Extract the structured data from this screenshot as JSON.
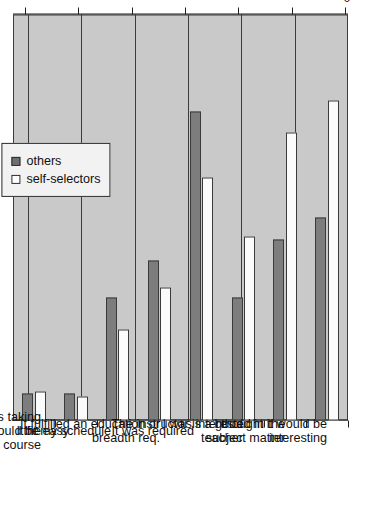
{
  "chart_data": {
    "type": "bar",
    "title": "",
    "subtitle": "",
    "orientation": "horizontal",
    "xlabel": "",
    "ylabel": "",
    "ylim": [
      0,
      60
    ],
    "grid": true,
    "legend_position": "top-left",
    "axis_ticks": [
      "0",
      "10",
      "20",
      "30",
      "40",
      "50",
      "60"
    ],
    "axis_tick_values": [
      0,
      10,
      20,
      30,
      40,
      50,
      60
    ],
    "categories": [
      "My friend(s) was taking the\ncourse",
      "I thought it would be easy",
      "It fit my schedule",
      "It fulfilled an education or\nbreadth req.",
      "It was required",
      "The instructor is a good\nteacher",
      "I was interested in the\nsubject matter",
      "I thought it would be\ninteresting"
    ],
    "series": [
      {
        "name": "others",
        "color": "#7d7d7d",
        "values": [
          5,
          5,
          23,
          30,
          58,
          23,
          34,
          38
        ]
      },
      {
        "name": "self-selectors",
        "color": "#fbfbfb",
        "values": [
          5.5,
          4.5,
          17,
          25,
          45.5,
          34.5,
          54,
          60
        ]
      }
    ]
  },
  "legend": {
    "items": [
      {
        "label": "others",
        "swatch": "filled-square-dark"
      },
      {
        "label": "self-selectors",
        "swatch": "empty-square-white"
      }
    ]
  },
  "colors": {
    "plot_background": "#c9c9c9",
    "axis": "#1f1f1f",
    "grid": "#3b3b3b",
    "others_bar": "#7d7d7d",
    "self_selectors_bar": "#fbfbfb",
    "page_background": "#ffffff"
  }
}
